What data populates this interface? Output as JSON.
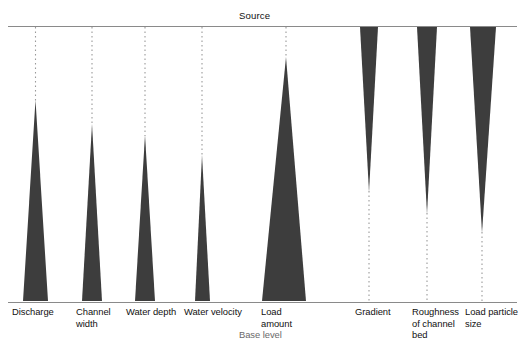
{
  "figure": {
    "type": "diagram",
    "title_top": "Source",
    "baseline_label": "Base level",
    "colors": {
      "wedge_fill": "#3d3d3d",
      "rule": "#8a8a8a",
      "dotted": "#9a9a9a",
      "text": "#111111",
      "text_muted": "#6a6a6a",
      "background": "#ffffff"
    },
    "geometry": {
      "top_rule_y": 26,
      "bottom_rule_y": 302,
      "width": 525,
      "height": 343
    },
    "variables": [
      {
        "id": "discharge",
        "label": "Discharge",
        "trend": "increases-downstream",
        "orientation": "apex-up",
        "axis_x": 35.5,
        "apex_y": 100,
        "base_y": 301,
        "base_left": 23,
        "base_right": 48,
        "label_x": 12,
        "label_y": 306
      },
      {
        "id": "channel-width",
        "label": "Channel\nwidth",
        "trend": "increases-downstream",
        "orientation": "apex-up",
        "axis_x": 92,
        "apex_y": 124,
        "base_y": 301,
        "base_left": 82,
        "base_right": 102,
        "label_x": 76,
        "label_y": 306
      },
      {
        "id": "water-depth",
        "label": "Water depth",
        "trend": "increases-downstream",
        "orientation": "apex-up",
        "axis_x": 145,
        "apex_y": 135,
        "base_y": 301,
        "base_left": 135,
        "base_right": 155,
        "label_x": 126,
        "label_y": 306
      },
      {
        "id": "water-velocity",
        "label": "Water velocity",
        "trend": "increases-downstream",
        "orientation": "apex-up",
        "axis_x": 202,
        "apex_y": 155,
        "base_y": 301,
        "base_left": 195,
        "base_right": 210,
        "label_x": 184,
        "label_y": 306
      },
      {
        "id": "load-amount",
        "label": "Load\namount",
        "trend": "increases-downstream",
        "orientation": "apex-up",
        "axis_x": 286,
        "apex_y": 57,
        "base_y": 301,
        "base_left": 262,
        "base_right": 306,
        "label_x": 261,
        "label_y": 306
      },
      {
        "id": "gradient",
        "label": "Gradient",
        "trend": "decreases-downstream",
        "orientation": "apex-down",
        "axis_x": 369,
        "apex_y": 192,
        "base_y": 27,
        "base_left": 360,
        "base_right": 378,
        "label_x": 355,
        "label_y": 306
      },
      {
        "id": "roughness-of-channel-bed",
        "label": "Roughness\nof channel\nbed",
        "trend": "decreases-downstream",
        "orientation": "apex-down",
        "axis_x": 427,
        "apex_y": 214,
        "base_y": 27,
        "base_left": 417,
        "base_right": 437,
        "label_x": 412,
        "label_y": 306
      },
      {
        "id": "load-particle-size",
        "label": "Load particle\nsize",
        "trend": "decreases-downstream",
        "orientation": "apex-down",
        "axis_x": 482,
        "apex_y": 233,
        "base_y": 27,
        "base_left": 470,
        "base_right": 496,
        "label_x": 465,
        "label_y": 306
      }
    ],
    "source_label_x": 239,
    "source_label_y": 10,
    "base_level_label_x": 239,
    "base_level_label_y": 329
  }
}
